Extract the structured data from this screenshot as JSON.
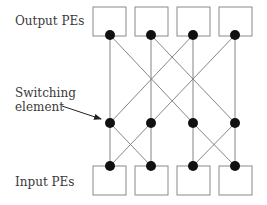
{
  "labels": {
    "output": "Output PEs",
    "switching_line1": "Switching",
    "switching_line2": "element",
    "input": "Input PEs"
  },
  "colors": {
    "line": "#777777",
    "box": "#8a8a8a",
    "node": "#111111",
    "text": "#3a3a3a"
  },
  "diagram": {
    "columns_x": [
      110,
      151,
      193,
      235
    ],
    "output_pes": 4,
    "input_pes": 4,
    "stages": [
      {
        "name": "output-stage",
        "y": 35
      },
      {
        "name": "middle-stage",
        "y": 123
      },
      {
        "name": "input-stage",
        "y": 166
      }
    ]
  }
}
